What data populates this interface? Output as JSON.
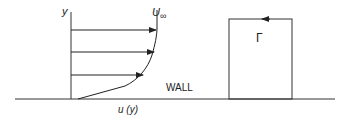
{
  "diagram": {
    "axis_label_y": "y",
    "freestream_label": "U",
    "freestream_subscript": "∞",
    "wall_label": "WALL",
    "profile_label": "u (y)",
    "circulation_label": "Γ",
    "colors": {
      "line": "#222222",
      "background": "#ffffff"
    }
  }
}
